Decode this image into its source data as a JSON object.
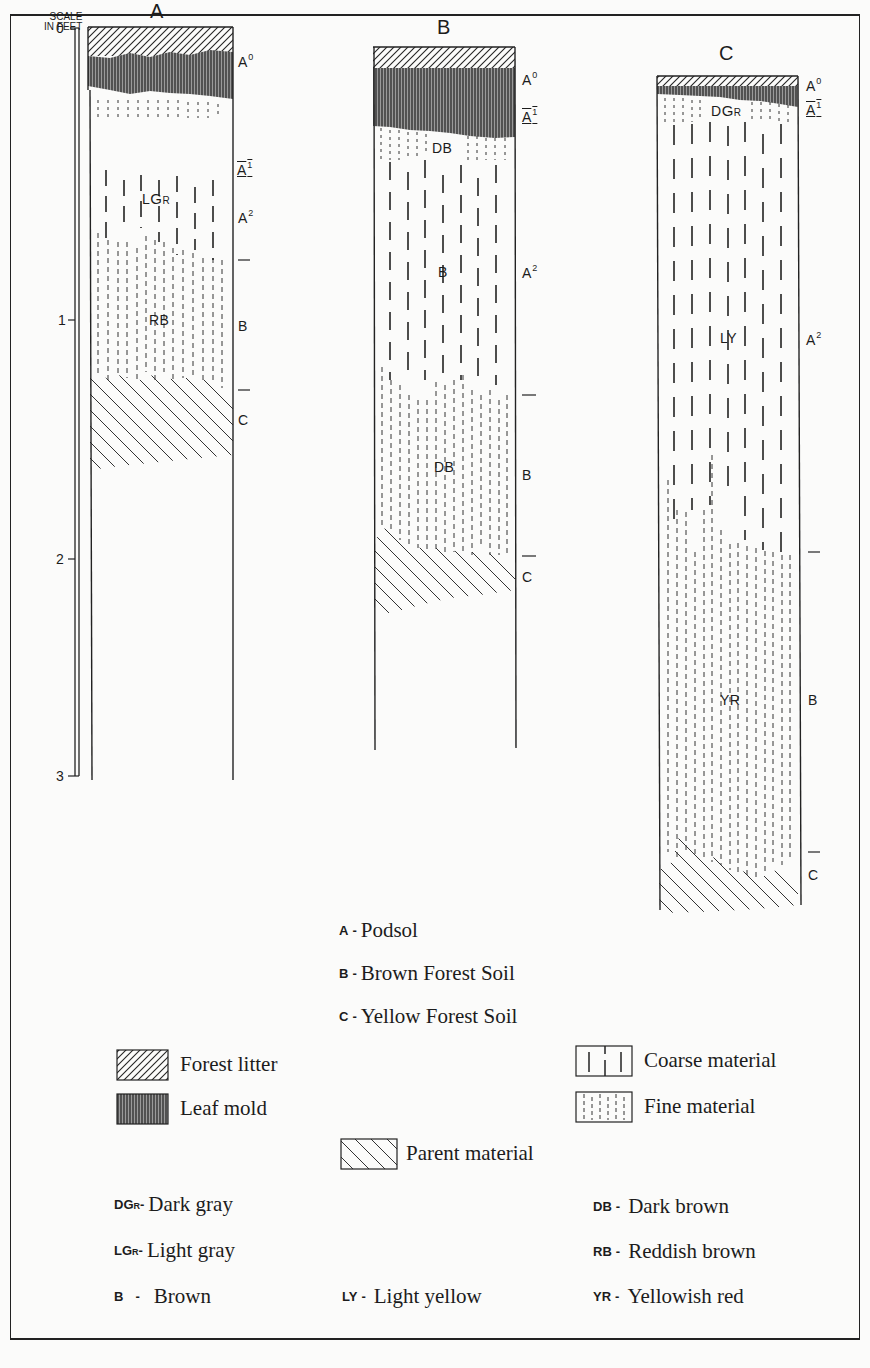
{
  "diagram": {
    "scale": {
      "title_line1": "SCALE",
      "title_line2": "IN FEET",
      "ticks": [
        "0",
        "1",
        "2",
        "3"
      ]
    },
    "columns": [
      {
        "id": "A",
        "title": "A",
        "horizons": [
          "A0",
          "A1",
          "A2",
          "B",
          "C"
        ],
        "color_labels": [
          "LGr",
          "RB"
        ]
      },
      {
        "id": "B",
        "title": "B",
        "horizons": [
          "A0",
          "A1",
          "A2",
          "B",
          "C"
        ],
        "color_labels": [
          "DB",
          "B",
          "DB"
        ]
      },
      {
        "id": "C",
        "title": "C",
        "horizons": [
          "A0",
          "A1",
          "A2",
          "B",
          "C"
        ],
        "color_labels": [
          "DGr",
          "LY",
          "YR"
        ]
      }
    ],
    "soil_types": [
      {
        "code": "A",
        "sep": "-",
        "name": "Podsol"
      },
      {
        "code": "B",
        "sep": "-",
        "name": "Brown Forest Soil"
      },
      {
        "code": "C",
        "sep": "-",
        "name": "Yellow Forest Soil"
      }
    ],
    "patterns": [
      {
        "icon": "forest-litter-swatch",
        "label": "Forest litter"
      },
      {
        "icon": "leaf-mold-swatch",
        "label": "Leaf mold"
      },
      {
        "icon": "coarse-material-swatch",
        "label": "Coarse material"
      },
      {
        "icon": "fine-material-swatch",
        "label": "Fine material"
      },
      {
        "icon": "parent-material-swatch",
        "label": "Parent material"
      }
    ],
    "colors": [
      {
        "code": "DGr",
        "sep": "-",
        "name": "Dark gray"
      },
      {
        "code": "LGr",
        "sep": "-",
        "name": "Light gray"
      },
      {
        "code": "B",
        "sep": "-",
        "name": "Brown"
      },
      {
        "code": "LY",
        "sep": "-",
        "name": "Light yellow"
      },
      {
        "code": "DB",
        "sep": "-",
        "name": "Dark brown"
      },
      {
        "code": "RB",
        "sep": "-",
        "name": "Reddish brown"
      },
      {
        "code": "YR",
        "sep": "-",
        "name": "Yellowish red"
      }
    ]
  }
}
